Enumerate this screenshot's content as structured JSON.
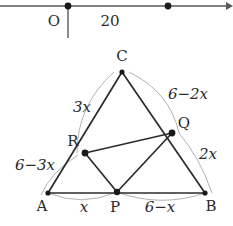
{
  "figure": {
    "number_line": {
      "origin_label": "O",
      "tick_label": "20",
      "points": [
        {
          "name": "origin-dot",
          "x": 68,
          "y": 6
        },
        {
          "name": "twenty-dot",
          "x": 168,
          "y": 6
        }
      ],
      "arrow_direction": "right"
    },
    "triangle": {
      "vertices": [
        {
          "label": "A",
          "x": 48,
          "y": 193
        },
        {
          "label": "B",
          "x": 205,
          "y": 193
        },
        {
          "label": "C",
          "x": 122,
          "y": 72
        }
      ],
      "interior_points": [
        {
          "label": "P",
          "x": 117,
          "y": 192
        },
        {
          "label": "Q",
          "x": 172,
          "y": 133
        },
        {
          "label": "R",
          "x": 85,
          "y": 153
        }
      ],
      "segment_labels": [
        {
          "name": "label-AR",
          "text": "6−3x"
        },
        {
          "name": "label-RC",
          "text": "3x"
        },
        {
          "name": "label-CQ",
          "text": "6−2x"
        },
        {
          "name": "label-QB",
          "text": "2x"
        },
        {
          "name": "label-AP",
          "text": "x"
        },
        {
          "name": "label-PB",
          "text": "6−x"
        }
      ]
    },
    "colors": {
      "stroke": "#2b2b2b",
      "arc_stroke": "#9a9a9a",
      "background": "#ffffff"
    }
  }
}
